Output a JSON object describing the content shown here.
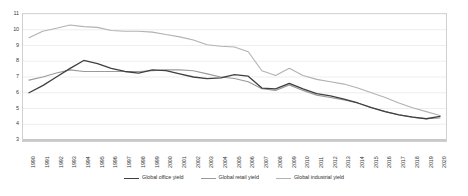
{
  "chart_data": {
    "type": "line",
    "title": "",
    "subtitle": "",
    "xlabel": "",
    "ylabel": "",
    "ylim": [
      3,
      11
    ],
    "ytick_values": [
      3,
      4,
      5,
      6,
      7,
      8,
      9,
      10,
      11
    ],
    "grid": true,
    "grid_axis": "y",
    "legend_position": "bottom",
    "x": [
      1990,
      1991,
      1992,
      1993,
      1994,
      1995,
      1996,
      1997,
      1998,
      1999,
      2000,
      2001,
      2002,
      2003,
      2004,
      2005,
      2006,
      2007,
      2008,
      2009,
      2010,
      2011,
      2012,
      2013,
      2014,
      2015,
      2016,
      2017,
      2018,
      2019,
      2020
    ],
    "categories": [
      "1990",
      "1991",
      "1992",
      "1993",
      "1994",
      "1995",
      "1996",
      "1997",
      "1998",
      "1999",
      "2000",
      "2001",
      "2002",
      "2003",
      "2004",
      "2005",
      "2006",
      "2007",
      "2008",
      "2009",
      "2010",
      "2011",
      "2012",
      "2013",
      "2014",
      "2015",
      "2016",
      "2017",
      "2018",
      "2019",
      "2020"
    ],
    "series": [
      {
        "name": "Global office yield",
        "color": "#3f3f3f",
        "width": 1.3,
        "values": [
          6.0,
          6.45,
          7.0,
          7.55,
          8.05,
          7.85,
          7.55,
          7.35,
          7.25,
          7.45,
          7.4,
          7.2,
          7.0,
          6.9,
          6.95,
          7.15,
          7.05,
          6.3,
          6.25,
          6.6,
          6.25,
          5.95,
          5.8,
          5.6,
          5.35,
          5.05,
          4.8,
          4.6,
          4.45,
          4.35,
          4.5
        ]
      },
      {
        "name": "Global retail yield",
        "color": "#9a9a9a",
        "width": 1.1,
        "values": [
          6.8,
          7.0,
          7.25,
          7.45,
          7.35,
          7.35,
          7.35,
          7.35,
          7.35,
          7.4,
          7.45,
          7.45,
          7.4,
          7.2,
          7.0,
          6.9,
          6.7,
          6.25,
          6.15,
          6.5,
          6.15,
          5.85,
          5.7,
          5.55,
          5.35,
          5.05,
          4.8,
          4.6,
          4.45,
          4.35,
          4.4
        ]
      },
      {
        "name": "Global industrial yield",
        "color": "#b2b2b2",
        "width": 1.1,
        "values": [
          9.5,
          9.9,
          10.1,
          10.3,
          10.2,
          10.15,
          9.95,
          9.9,
          9.9,
          9.85,
          9.7,
          9.55,
          9.35,
          9.05,
          8.95,
          8.9,
          8.6,
          7.4,
          7.1,
          7.55,
          7.1,
          6.85,
          6.7,
          6.55,
          6.3,
          6.0,
          5.7,
          5.35,
          5.05,
          4.8,
          4.55
        ]
      }
    ]
  },
  "legend": {
    "items": [
      {
        "label": "Global office yield"
      },
      {
        "label": "Global retail yield"
      },
      {
        "label": "Global industrial yield"
      }
    ]
  }
}
